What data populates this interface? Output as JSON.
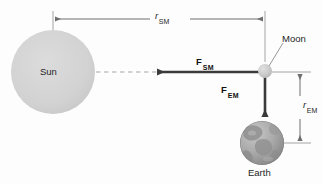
{
  "figure": {
    "kind": "physics-force-diagram",
    "background_color": "#fdfdfd",
    "bodies": {
      "sun": {
        "label": "Sun",
        "fill_color": "#d2d2d2",
        "cx": 53,
        "cy": 72,
        "r": 42
      },
      "moon": {
        "label": "Moon",
        "fill_color": "#c9c9c9",
        "cx": 265,
        "cy": 71,
        "r": 7
      },
      "earth": {
        "label": "Earth",
        "fill_color": "#a9a9a9",
        "cx": 262,
        "cy": 143,
        "r": 22
      }
    },
    "forces": [
      {
        "name": "force-sun-on-moon",
        "symbol": "F",
        "subscript": "SM",
        "direction": "left",
        "color": "#3a3a3a",
        "from_x": 265,
        "from_y": 72,
        "to_x": 155,
        "to_y": 72
      },
      {
        "name": "force-earth-on-moon",
        "symbol": "F",
        "subscript": "EM",
        "direction": "down",
        "color": "#3a3a3a",
        "from_x": 265,
        "from_y": 72,
        "to_x": 265,
        "to_y": 119
      }
    ],
    "dimensions": [
      {
        "name": "distance-sun-moon",
        "symbol": "r",
        "subscript": "SM",
        "orientation": "horizontal",
        "color": "#6e6e6e",
        "start": 53,
        "end": 265,
        "axis": 19
      },
      {
        "name": "distance-earth-moon",
        "symbol": "r",
        "subscript": "EM",
        "orientation": "vertical",
        "color": "#6e6e6e",
        "start": 72,
        "end": 143,
        "axis": 300
      }
    ],
    "guide_line": {
      "name": "sun-moon-axis-dashed",
      "style": "dashed",
      "color": "#c4c4c4",
      "from_x": 96,
      "from_y": 72,
      "to_x": 158,
      "to_y": 72
    },
    "leader_line": {
      "name": "moon-callout-leader",
      "color": "#8a8a8a",
      "from_x": 270,
      "from_y": 66,
      "to_x": 283,
      "to_y": 42
    }
  }
}
